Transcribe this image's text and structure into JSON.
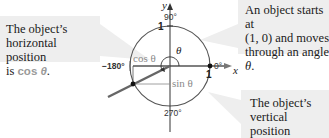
{
  "notes": {
    "left": {
      "line1": "The object’s",
      "line2": "horizontal position",
      "prefix": "is ",
      "func": "cos",
      "var": "θ",
      "suffix": "."
    },
    "right": {
      "line1": "An object starts at",
      "line2": "(1, 0) and moves",
      "line3": "through an angle ",
      "var": "θ",
      "suffix": "."
    },
    "bottom": {
      "line1": "The object’s",
      "line2": "vertical position",
      "prefix": "is ",
      "func": "sin",
      "var": "θ",
      "suffix": "."
    }
  },
  "diagram": {
    "axes": {
      "x_label": "x",
      "y_label": "y"
    },
    "angle_labels": {
      "deg0": "0°",
      "deg90": "90°",
      "deg180": "−180°",
      "deg270": "270°"
    },
    "unit_labels": {
      "x_one": "1",
      "y_one": "1"
    },
    "theta": "θ",
    "cos_label": "cos θ",
    "sin_label": "sin θ"
  },
  "colors": {
    "callout_bg": "#eeeeee",
    "highlight_text": "#9a9a9a",
    "ray": "#666666",
    "circle": "#555555"
  }
}
